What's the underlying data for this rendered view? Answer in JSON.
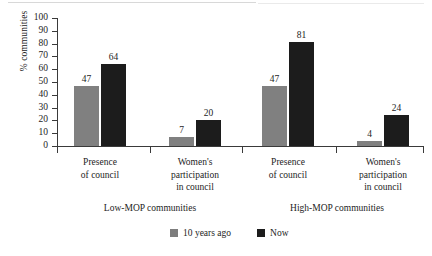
{
  "chart_data": {
    "type": "bar",
    "title": "",
    "subtitle": "",
    "xlabel": "",
    "ylabel": "% communities",
    "ylim": [
      0,
      100
    ],
    "yticks": [
      0,
      10,
      20,
      30,
      40,
      50,
      60,
      70,
      80,
      90,
      100
    ],
    "grid": false,
    "legend_position": "bottom",
    "categories": [
      "Presence of council",
      "Women's participation in council",
      "Presence of council",
      "Women's participation in council"
    ],
    "category_label_lines": [
      [
        "Presence",
        "of council"
      ],
      [
        "Women's",
        "participation",
        "in council"
      ],
      [
        "Presence",
        "of council"
      ],
      [
        "Women's",
        "participation",
        "in council"
      ]
    ],
    "groups": [
      {
        "label": "Low-MOP communities",
        "categories": [
          0,
          1
        ]
      },
      {
        "label": "High-MOP communities",
        "categories": [
          2,
          3
        ]
      }
    ],
    "series": [
      {
        "name": "10 years ago",
        "color": "#808080",
        "values": [
          47,
          7,
          47,
          4
        ]
      },
      {
        "name": "Now",
        "color": "#1c1c1c",
        "values": [
          64,
          20,
          81,
          24
        ]
      }
    ]
  },
  "axis": {
    "y_label": "% communities",
    "y_tick_labels": [
      "100",
      "90",
      "80",
      "70",
      "60",
      "50",
      "40",
      "30",
      "20",
      "10",
      "0"
    ]
  },
  "legend": {
    "items": [
      {
        "label": "10 years ago",
        "swatch": "legend-swatch-gray"
      },
      {
        "label": "Now",
        "swatch": "legend-swatch-black"
      }
    ]
  },
  "colors": {
    "series_then": "#808080",
    "series_now": "#1c1c1c",
    "axis": "#3a3a3a",
    "text": "#1d1d1d",
    "background": "#ffffff"
  }
}
